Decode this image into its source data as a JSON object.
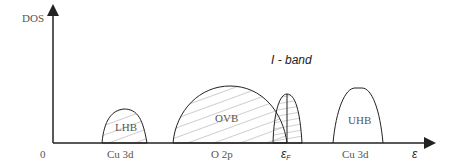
{
  "axes": {
    "y_label": "DOS",
    "x_label": "ε",
    "origin_label": "0"
  },
  "bands": [
    {
      "name": "LHB",
      "label": "LHB",
      "orbital": "Cu 3d",
      "hatched": true
    },
    {
      "name": "OVB",
      "label": "OVB",
      "orbital": "O 2p",
      "hatched": true
    },
    {
      "name": "I-band",
      "label": "I - band",
      "orbital": "ε_F",
      "hatched": true
    },
    {
      "name": "UHB",
      "label": "UHB",
      "orbital": "Cu 3d",
      "hatched": false
    }
  ],
  "x_ticks": [
    "Cu 3d",
    "O 2p",
    "ε",
    "Cu 3d"
  ],
  "fermi_subscript": "F",
  "colors": {
    "line": "#222222",
    "hatch": "#777777"
  }
}
